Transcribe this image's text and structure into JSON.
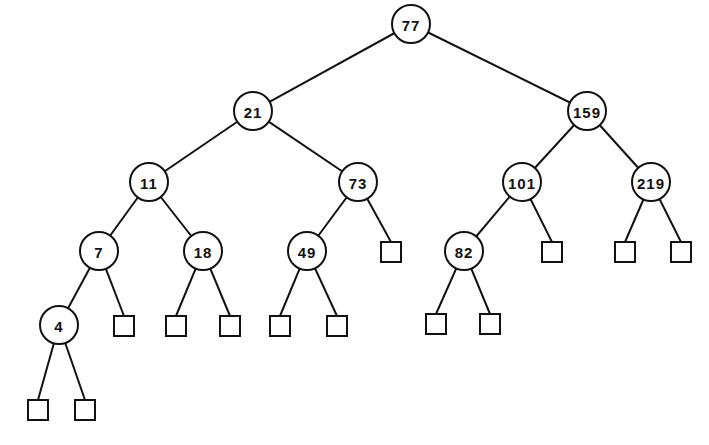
{
  "diagram": {
    "type": "binary-search-tree",
    "node_radius": 19,
    "leaf_size": 20,
    "colors": {
      "stroke": "#111111",
      "fill": "#ffffff"
    },
    "nodes": [
      {
        "id": "n77",
        "label": "77",
        "x": 411,
        "y": 24
      },
      {
        "id": "n21",
        "label": "21",
        "x": 253,
        "y": 111
      },
      {
        "id": "n159",
        "label": "159",
        "x": 587,
        "y": 111
      },
      {
        "id": "n11",
        "label": "11",
        "x": 149,
        "y": 182
      },
      {
        "id": "n73",
        "label": "73",
        "x": 358,
        "y": 182
      },
      {
        "id": "n101",
        "label": "101",
        "x": 522,
        "y": 182
      },
      {
        "id": "n219",
        "label": "219",
        "x": 651,
        "y": 182
      },
      {
        "id": "n7",
        "label": "7",
        "x": 99,
        "y": 251
      },
      {
        "id": "n18",
        "label": "18",
        "x": 203,
        "y": 251
      },
      {
        "id": "n49",
        "label": "49",
        "x": 307,
        "y": 251
      },
      {
        "id": "n82",
        "label": "82",
        "x": 464,
        "y": 251
      },
      {
        "id": "n4",
        "label": "4",
        "x": 59,
        "y": 325
      }
    ],
    "leaves": [
      {
        "id": "l4a",
        "x": 38,
        "y": 410
      },
      {
        "id": "l4b",
        "x": 85,
        "y": 410
      },
      {
        "id": "l7b",
        "x": 124,
        "y": 326
      },
      {
        "id": "l18a",
        "x": 176,
        "y": 326
      },
      {
        "id": "l18b",
        "x": 230,
        "y": 326
      },
      {
        "id": "l49a",
        "x": 280,
        "y": 326
      },
      {
        "id": "l49b",
        "x": 337,
        "y": 326
      },
      {
        "id": "l73b",
        "x": 391,
        "y": 252
      },
      {
        "id": "l82a",
        "x": 436,
        "y": 324
      },
      {
        "id": "l82b",
        "x": 490,
        "y": 324
      },
      {
        "id": "l101b",
        "x": 552,
        "y": 252
      },
      {
        "id": "l219a",
        "x": 625,
        "y": 252
      },
      {
        "id": "l219b",
        "x": 681,
        "y": 252
      }
    ],
    "edges": [
      [
        "n77",
        "n21"
      ],
      [
        "n77",
        "n159"
      ],
      [
        "n21",
        "n11"
      ],
      [
        "n21",
        "n73"
      ],
      [
        "n159",
        "n101"
      ],
      [
        "n159",
        "n219"
      ],
      [
        "n11",
        "n7"
      ],
      [
        "n11",
        "n18"
      ],
      [
        "n73",
        "n49"
      ],
      [
        "n73",
        "l73b"
      ],
      [
        "n101",
        "n82"
      ],
      [
        "n101",
        "l101b"
      ],
      [
        "n219",
        "l219a"
      ],
      [
        "n219",
        "l219b"
      ],
      [
        "n7",
        "n4"
      ],
      [
        "n7",
        "l7b"
      ],
      [
        "n18",
        "l18a"
      ],
      [
        "n18",
        "l18b"
      ],
      [
        "n49",
        "l49a"
      ],
      [
        "n49",
        "l49b"
      ],
      [
        "n82",
        "l82a"
      ],
      [
        "n82",
        "l82b"
      ],
      [
        "n4",
        "l4a"
      ],
      [
        "n4",
        "l4b"
      ]
    ]
  }
}
